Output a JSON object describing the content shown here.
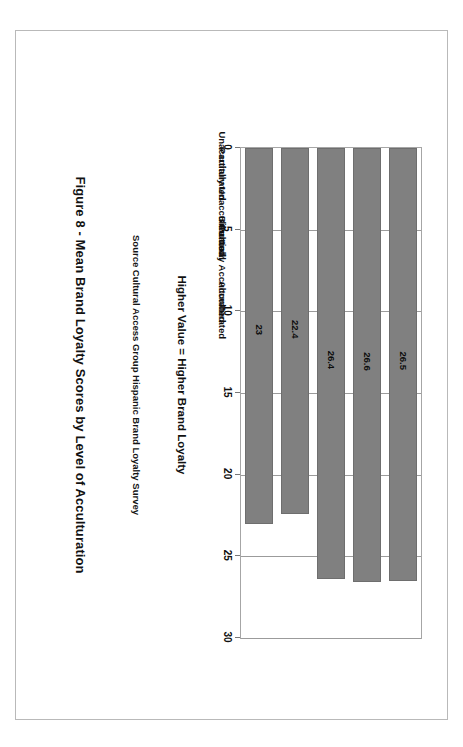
{
  "figure": {
    "caption": "Figure 8 - Mean Brand Loyalty Scores by Level of Acculturation",
    "source": "Source Cultural Access Group Hispanic Brand Loyalty Survey",
    "axis_title": "Higher Value = Higher Brand Loyalty",
    "orientation": "rotated-90-clockwise"
  },
  "colors": {
    "bar_fill": "#808080",
    "bar_stroke": "#6e6e6e",
    "gridline": "#9b9b9b",
    "plot_border": "#a6a6a6",
    "page_border": "#b9b9b9",
    "text": "#111111",
    "background": "#ffffff"
  },
  "chart_data": {
    "type": "bar",
    "title": "Figure 8 - Mean Brand Loyalty Scores by Level of Acculturation",
    "subtitle": "Source Cultural Access Group Hispanic Brand Loyalty Survey",
    "xlabel": "Higher Value = Higher Brand Loyalty",
    "ylabel": "",
    "categories": [
      "Unacculturated",
      "Partially Unacculturated",
      "Bicultural",
      "Partially Acculturated",
      "Acculturated"
    ],
    "values": [
      26.5,
      26.6,
      26.4,
      22.4,
      23
    ],
    "value_labels": [
      "26.5",
      "26.6",
      "26.4",
      "22.4",
      "23"
    ],
    "xlim": [
      0,
      30
    ],
    "ticks": [
      0,
      5,
      10,
      15,
      20,
      25,
      30
    ],
    "tick_labels": [
      "0",
      "5",
      "10",
      "15",
      "20",
      "25",
      "30"
    ],
    "grid": true,
    "legend": false,
    "legend_position": "none",
    "bar_orientation": "horizontal"
  }
}
